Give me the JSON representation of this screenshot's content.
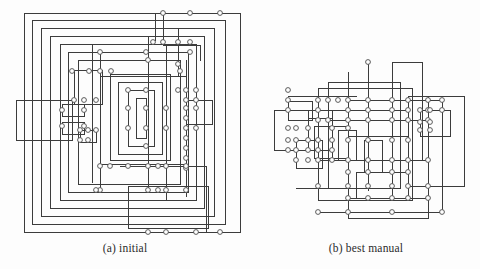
{
  "figure": {
    "kind": "orthogonal-graph-drawing-pair",
    "stroke_color": "#3c3c3c",
    "node_fill": "#ffffff",
    "node_stroke": "#4a4a4a",
    "background": "#fdfdfd",
    "node_radius": 2.4
  },
  "panels": [
    {
      "id": "a",
      "caption": "(a) initial",
      "viewbox": "0 0 250 240",
      "edges": [
        "M24,13 H240 V232 H24 Z",
        "M32,20 H225 V224 H32 Z",
        "M41,28 H214 V216 H41 Z",
        "M50,36 H204 V208 H50 Z",
        "M60,44 H196 V200 H60 Z",
        "M68,52 H188 V192 H68 Z",
        "M78,60 H180 V184 H78 Z",
        "M16,100 H72 V140 H16 Z",
        "M100,52 H100 V52",
        "M100,52 V76 H186 V164 H100 V140",
        "M110,74 H170 V160 H110 Z",
        "M118,82 H162 V154 H118 Z",
        "M128,90 H154 V146 H128 Z",
        "M136,98 H146 V138 H136 Z",
        "M163,13 V45 H200 V60",
        "M155,13 V40",
        "M186,100 H212 V124 H186",
        "M120,166 H206 V232",
        "M128,186 H208 V228 H128 Z",
        "M74,70 H102 V104 H74 Z",
        "M62,104 H84 V116 H62 Z",
        "M62,122 H84 V134 H62 Z",
        "M80,130 H96 V142 H80 Z",
        "M100,60 V190",
        "M186,60 V196",
        "M178,28 V76",
        "M148,36 V190",
        "M166,44 V200",
        "M92,44 V182"
      ],
      "nodes": [
        [
          163,
          13
        ],
        [
          190,
          13
        ],
        [
          220,
          13
        ],
        [
          153,
          42
        ],
        [
          163,
          42
        ],
        [
          178,
          42
        ],
        [
          190,
          42
        ],
        [
          146,
          52
        ],
        [
          190,
          52
        ],
        [
          100,
          52
        ],
        [
          72,
          71
        ],
        [
          89,
          71
        ],
        [
          100,
          71
        ],
        [
          111,
          71
        ],
        [
          180,
          71
        ],
        [
          148,
          60
        ],
        [
          178,
          64
        ],
        [
          186,
          90
        ],
        [
          196,
          90
        ],
        [
          178,
          90
        ],
        [
          186,
          100
        ],
        [
          196,
          100
        ],
        [
          128,
          90
        ],
        [
          146,
          90
        ],
        [
          128,
          108
        ],
        [
          146,
          108
        ],
        [
          166,
          108
        ],
        [
          186,
          108
        ],
        [
          196,
          108
        ],
        [
          74,
          100
        ],
        [
          84,
          100
        ],
        [
          96,
          100
        ],
        [
          62,
          110
        ],
        [
          84,
          110
        ],
        [
          62,
          126
        ],
        [
          84,
          126
        ],
        [
          128,
          128
        ],
        [
          146,
          128
        ],
        [
          166,
          128
        ],
        [
          186,
          128
        ],
        [
          196,
          128
        ],
        [
          80,
          130
        ],
        [
          88,
          130
        ],
        [
          96,
          130
        ],
        [
          80,
          140
        ],
        [
          88,
          140
        ],
        [
          186,
          118
        ],
        [
          186,
          138
        ],
        [
          186,
          148
        ],
        [
          186,
          158
        ],
        [
          186,
          168
        ],
        [
          146,
          146
        ],
        [
          100,
          166
        ],
        [
          110,
          166
        ],
        [
          128,
          166
        ],
        [
          148,
          166
        ],
        [
          158,
          166
        ],
        [
          166,
          166
        ],
        [
          186,
          166
        ],
        [
          100,
          190
        ],
        [
          148,
          190
        ],
        [
          158,
          190
        ],
        [
          166,
          190
        ],
        [
          186,
          190
        ],
        [
          96,
          190
        ],
        [
          166,
          232
        ],
        [
          196,
          232
        ],
        [
          220,
          232
        ],
        [
          148,
          232
        ]
      ]
    },
    {
      "id": "b",
      "caption": "(b) best manual",
      "viewbox": "0 0 228 240",
      "edges": [
        "M36,101 H60 V120 H36 Z",
        "M22,110 H56 V150 H22 Z",
        "M66,88 H160 V200 H66 Z",
        "M76,82 H148 V188 H76 Z",
        "M96,100 H190 V212 H96 Z",
        "M140,62 H170 V160 H140 Z",
        "M156,96 H212 V186 H156 Z",
        "M168,110 H198 V136 H168 Z",
        "M56,118 H80 V150 H56 Z",
        "M62,126 H96 V158 H62 Z",
        "M44,140 H70 V168 H44 Z",
        "M86,130 H104 V160 H86 Z",
        "M112,140 H130 V172 H112 Z",
        "M104,172 H156 V198 H104 Z",
        "M96,198 H176 V218 H96 Z",
        "M66,100 V200",
        "M96,72 V200",
        "M116,62 V190",
        "M140,96 V196",
        "M176,96 V200",
        "M190,110 V202",
        "M156,110 V190",
        "M80,110 V160",
        "M36,96 H104",
        "M36,110 H156",
        "M76,120 H176",
        "M96,136 H156",
        "M66,160 H176",
        "M44,188 H140",
        "M66,212 H190"
      ],
      "nodes": [
        [
          116,
          62
        ],
        [
          36,
          90
        ],
        [
          36,
          100
        ],
        [
          96,
          100
        ],
        [
          116,
          100
        ],
        [
          76,
          100
        ],
        [
          86,
          100
        ],
        [
          66,
          100
        ],
        [
          156,
          100
        ],
        [
          176,
          100
        ],
        [
          190,
          100
        ],
        [
          140,
          100
        ],
        [
          66,
          110
        ],
        [
          96,
          110
        ],
        [
          116,
          110
        ],
        [
          140,
          110
        ],
        [
          156,
          110
        ],
        [
          176,
          110
        ],
        [
          190,
          110
        ],
        [
          36,
          110
        ],
        [
          168,
          110
        ],
        [
          178,
          110
        ],
        [
          66,
          120
        ],
        [
          76,
          120
        ],
        [
          96,
          120
        ],
        [
          116,
          120
        ],
        [
          140,
          120
        ],
        [
          156,
          120
        ],
        [
          176,
          120
        ],
        [
          168,
          122
        ],
        [
          178,
          122
        ],
        [
          168,
          130
        ],
        [
          178,
          130
        ],
        [
          36,
          128
        ],
        [
          44,
          128
        ],
        [
          56,
          128
        ],
        [
          80,
          128
        ],
        [
          96,
          128
        ],
        [
          36,
          140
        ],
        [
          44,
          140
        ],
        [
          56,
          140
        ],
        [
          66,
          140
        ],
        [
          80,
          140
        ],
        [
          96,
          140
        ],
        [
          116,
          140
        ],
        [
          140,
          140
        ],
        [
          156,
          140
        ],
        [
          36,
          150
        ],
        [
          44,
          150
        ],
        [
          56,
          150
        ],
        [
          66,
          150
        ],
        [
          80,
          150
        ],
        [
          44,
          160
        ],
        [
          56,
          160
        ],
        [
          66,
          160
        ],
        [
          80,
          160
        ],
        [
          96,
          160
        ],
        [
          116,
          160
        ],
        [
          140,
          160
        ],
        [
          156,
          160
        ],
        [
          176,
          160
        ],
        [
          96,
          172
        ],
        [
          116,
          172
        ],
        [
          140,
          172
        ],
        [
          156,
          172
        ],
        [
          66,
          186
        ],
        [
          96,
          186
        ],
        [
          116,
          186
        ],
        [
          140,
          186
        ],
        [
          156,
          186
        ],
        [
          176,
          186
        ],
        [
          96,
          198
        ],
        [
          116,
          198
        ],
        [
          140,
          198
        ],
        [
          156,
          198
        ],
        [
          176,
          198
        ],
        [
          66,
          212
        ],
        [
          96,
          212
        ],
        [
          140,
          212
        ],
        [
          190,
          212
        ]
      ]
    }
  ]
}
